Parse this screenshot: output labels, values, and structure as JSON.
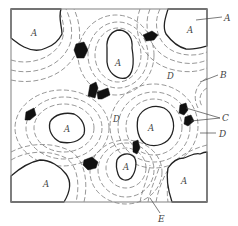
{
  "figure": {
    "type": "microstructure-schematic",
    "frame": {
      "x": 11,
      "y": 9,
      "width": 196,
      "height": 193
    },
    "regions": {
      "A": {
        "label": "A",
        "description": "grain region (solid outline)"
      },
      "B": {
        "label": "B",
        "description": "dashed contour band"
      },
      "C": {
        "label": "C",
        "description": "black particle"
      },
      "D": {
        "label": "D",
        "description": "matrix region between contours"
      },
      "E": {
        "label": "E",
        "description": "dashed contour band (bottom)"
      }
    },
    "inner_labels": [
      {
        "id": "A-top-left",
        "text": "A",
        "x": 33,
        "y": 37
      },
      {
        "id": "A-top-center",
        "text": "A",
        "x": 117,
        "y": 63
      },
      {
        "id": "A-top-right",
        "text": "A",
        "x": 187,
        "y": 33
      },
      {
        "id": "D-top-right",
        "text": "D",
        "x": 169,
        "y": 77
      },
      {
        "id": "A-mid-left",
        "text": "A",
        "x": 66,
        "y": 128
      },
      {
        "id": "D-center",
        "text": "D",
        "x": 114,
        "y": 121
      },
      {
        "id": "A-center-right",
        "text": "A",
        "x": 149,
        "y": 128
      },
      {
        "id": "A-bottom-left",
        "text": "A",
        "x": 43,
        "y": 186
      },
      {
        "id": "A-bottom-center",
        "text": "A",
        "x": 124,
        "y": 167
      },
      {
        "id": "A-bottom-right",
        "text": "A",
        "x": 182,
        "y": 182
      }
    ],
    "callouts": [
      {
        "id": "callout-A",
        "text": "A",
        "x": 226,
        "y": 20
      },
      {
        "id": "callout-B",
        "text": "B",
        "x": 221,
        "y": 77
      },
      {
        "id": "callout-C",
        "text": "C",
        "x": 224,
        "y": 120
      },
      {
        "id": "callout-D",
        "text": "D",
        "x": 221,
        "y": 136
      },
      {
        "id": "callout-E",
        "text": "E",
        "x": 161,
        "y": 221
      }
    ]
  }
}
